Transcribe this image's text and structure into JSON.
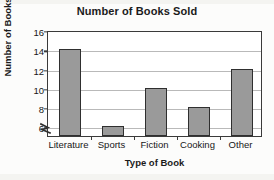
{
  "chart_data": {
    "type": "bar",
    "title": "Number of Books Sold",
    "xlabel": "Type of Book",
    "ylabel": "Number of Books",
    "categories": [
      "Literature",
      "Sports",
      "Fiction",
      "Cooking",
      "Other"
    ],
    "values": [
      14,
      6,
      10,
      8,
      12
    ],
    "ylim": [
      5,
      16
    ],
    "ytick_labels": [
      "16",
      "14",
      "12",
      "10",
      "8",
      "6"
    ],
    "ytick_values": [
      16,
      14,
      12,
      10,
      8,
      6
    ],
    "grid": true,
    "legend": false,
    "axis_break": true,
    "bar_color": "#9a9a9a",
    "bar_border_color": "#2f2f2f",
    "gridline_color": "#b9b9b9",
    "axis_color": "#3a3a3a",
    "background_color": "#ffffff"
  },
  "axis_break_icon": "axis-break-zigzag"
}
